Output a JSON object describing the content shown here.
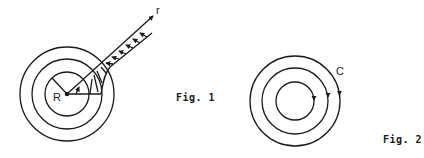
{
  "figures": [
    {
      "id": "fig1",
      "caption": "Fig. 1",
      "labels": {
        "radius": "R",
        "radial_axis": "r"
      },
      "center": [
        67,
        94
      ],
      "circle_radii": [
        22,
        35,
        47
      ],
      "description": "Concentric circles with a radial axis r drawn at ~42 degrees; profile arrows perpendicular to the axis show a distribution decreasing outward, with a hatched region near the inner circle"
    },
    {
      "id": "fig2",
      "caption": "Fig. 2",
      "labels": {
        "contour": "C"
      },
      "center": [
        295,
        101
      ],
      "circle_radii": [
        19,
        33,
        45
      ],
      "description": "Three concentric circles each with a downward arrow on the right side indicating clockwise circulation; outermost labeled C"
    }
  ],
  "colors": {
    "stroke": "#1a1a1a",
    "background": "#ffffff"
  }
}
